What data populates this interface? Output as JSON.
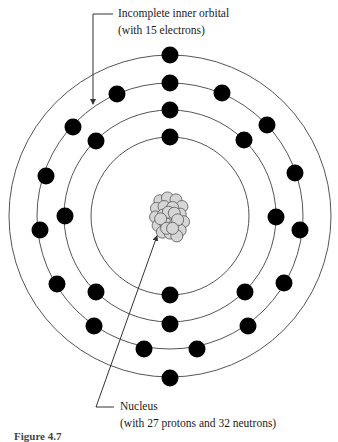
{
  "labels": {
    "orbital": {
      "line1": "Incomplete inner orbital",
      "line2": "(with 15 electrons)"
    },
    "nucleus": {
      "line1": "Nucleus",
      "line2": "(with 27 protons and 32 neutrons)"
    }
  },
  "caption": "Figure 4.7",
  "colors": {
    "orbit": "#555555",
    "electron": "#000000",
    "nucleon_fill": "#d6d6d6",
    "nucleon_stroke": "#555555",
    "leader": "#333333"
  },
  "atom": {
    "center": [
      170,
      216
    ],
    "shells": [
      {
        "radius": 79,
        "electron_count": 2
      },
      {
        "radius": 106,
        "electron_count": 8
      },
      {
        "radius": 133,
        "electron_count": 15
      },
      {
        "radius": 161,
        "electron_count": 2
      }
    ],
    "electrons": [
      [
        170,
        137
      ],
      [
        170,
        295
      ],
      [
        170,
        110
      ],
      [
        96,
        141
      ],
      [
        244,
        140
      ],
      [
        65,
        216
      ],
      [
        276,
        217
      ],
      [
        96,
        292
      ],
      [
        245,
        292
      ],
      [
        170,
        324
      ],
      [
        170,
        83
      ],
      [
        117,
        94
      ],
      [
        222,
        93
      ],
      [
        73,
        127
      ],
      [
        267,
        125
      ],
      [
        46,
        176
      ],
      [
        295,
        173
      ],
      [
        40,
        230
      ],
      [
        300,
        230
      ],
      [
        57,
        284
      ],
      [
        284,
        283
      ],
      [
        94,
        326
      ],
      [
        248,
        326
      ],
      [
        144,
        349
      ],
      [
        197,
        349
      ],
      [
        170,
        55
      ],
      [
        170,
        378
      ]
    ],
    "electron_radius": 8.5
  }
}
